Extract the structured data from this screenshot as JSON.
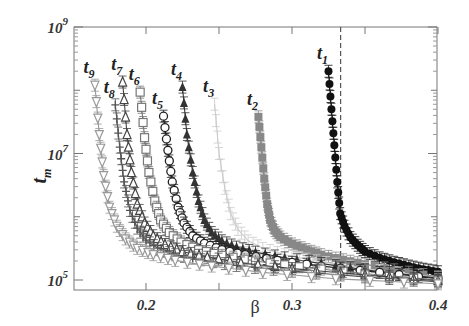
{
  "chart_data": {
    "type": "line",
    "title": "",
    "xlabel": "β",
    "ylabel": "t_m",
    "xlim": [
      0.15,
      0.4
    ],
    "ylim_log10": [
      4.84,
      9.0
    ],
    "yscale": "log",
    "grid": false,
    "legend_position": "inline labels above each curve",
    "x_ticks": [
      {
        "value": 0.2,
        "label": "0.2"
      },
      {
        "value": 0.3,
        "label": "0.3"
      },
      {
        "value": 0.4,
        "label": "0.4"
      }
    ],
    "y_ticks": [
      {
        "value": 5,
        "label": "10",
        "exp": "5"
      },
      {
        "value": 7,
        "label": "10",
        "exp": "7"
      },
      {
        "value": 9,
        "label": "10",
        "exp": "9"
      }
    ],
    "annotations": [
      {
        "type": "vertical-dashed-line",
        "x": 0.3333
      }
    ],
    "series": [
      {
        "name": "t1",
        "label": "t",
        "sub": "1",
        "marker": "filled-circle",
        "color": "#111111",
        "x": [
          0.325,
          0.327,
          0.329,
          0.331,
          0.333,
          0.336,
          0.34,
          0.345,
          0.35,
          0.36,
          0.37,
          0.38,
          0.39,
          0.4
        ],
        "log10_y": [
          8.3,
          7.7,
          7.13,
          6.55,
          6.05,
          5.85,
          5.67,
          5.55,
          5.45,
          5.35,
          5.28,
          5.22,
          5.17,
          5.13
        ]
      },
      {
        "name": "t2",
        "label": "t",
        "sub": "2",
        "marker": "filled-square",
        "color": "#888888",
        "x": [
          0.277,
          0.279,
          0.281,
          0.283,
          0.285,
          0.288,
          0.292,
          0.3,
          0.31,
          0.32,
          0.335,
          0.35,
          0.37,
          0.4
        ],
        "log10_y": [
          7.58,
          7.1,
          6.6,
          6.2,
          5.95,
          5.78,
          5.68,
          5.57,
          5.48,
          5.4,
          5.32,
          5.25,
          5.16,
          5.05
        ]
      },
      {
        "name": "t3",
        "label": "t",
        "sub": "3",
        "marker": "none",
        "color": "#cccccc",
        "x": [
          0.247,
          0.25,
          0.254,
          0.258,
          0.263,
          0.27,
          0.28,
          0.295,
          0.31,
          0.33,
          0.36,
          0.4
        ],
        "log10_y": [
          7.78,
          7.0,
          6.45,
          6.05,
          5.8,
          5.62,
          5.5,
          5.4,
          5.33,
          5.25,
          5.15,
          5.04
        ]
      },
      {
        "name": "t4",
        "label": "t",
        "sub": "4",
        "marker": "filled-triangle-up",
        "color": "#333333",
        "x": [
          0.225,
          0.228,
          0.232,
          0.236,
          0.24,
          0.245,
          0.252,
          0.262,
          0.275,
          0.295,
          0.32,
          0.35,
          0.4
        ],
        "log10_y": [
          8.05,
          7.3,
          6.7,
          6.25,
          5.95,
          5.75,
          5.62,
          5.52,
          5.44,
          5.35,
          5.26,
          5.16,
          5.03
        ]
      },
      {
        "name": "t5",
        "label": "t",
        "sub": "5",
        "marker": "open-circle",
        "color": "#222222",
        "x": [
          0.212,
          0.215,
          0.218,
          0.222,
          0.226,
          0.232,
          0.24,
          0.252,
          0.268,
          0.29,
          0.32,
          0.36,
          0.4
        ],
        "log10_y": [
          7.59,
          7.05,
          6.55,
          6.15,
          5.9,
          5.7,
          5.58,
          5.48,
          5.4,
          5.31,
          5.22,
          5.12,
          5.02
        ]
      },
      {
        "name": "t6",
        "label": "t",
        "sub": "6",
        "marker": "open-square",
        "color": "#777777",
        "x": [
          0.196,
          0.199,
          0.202,
          0.206,
          0.21,
          0.216,
          0.224,
          0.236,
          0.252,
          0.275,
          0.305,
          0.35,
          0.4
        ],
        "log10_y": [
          7.97,
          7.25,
          6.7,
          6.25,
          5.95,
          5.75,
          5.6,
          5.48,
          5.39,
          5.3,
          5.21,
          5.1,
          5.0
        ]
      },
      {
        "name": "t7",
        "label": "t",
        "sub": "7",
        "marker": "open-triangle-up",
        "color": "#444444",
        "x": [
          0.184,
          0.187,
          0.19,
          0.194,
          0.199,
          0.205,
          0.213,
          0.225,
          0.242,
          0.265,
          0.3,
          0.35,
          0.4
        ],
        "log10_y": [
          8.13,
          7.3,
          6.7,
          6.2,
          5.9,
          5.7,
          5.56,
          5.45,
          5.36,
          5.27,
          5.18,
          5.08,
          4.99
        ]
      },
      {
        "name": "t8",
        "label": "t",
        "sub": "8",
        "marker": "plus",
        "color": "#555555",
        "x": [
          0.179,
          0.182,
          0.185,
          0.189,
          0.194,
          0.2,
          0.208,
          0.22,
          0.238,
          0.262,
          0.3,
          0.35,
          0.4
        ],
        "log10_y": [
          7.77,
          7.1,
          6.55,
          6.1,
          5.82,
          5.63,
          5.5,
          5.4,
          5.32,
          5.23,
          5.14,
          5.05,
          4.97
        ]
      },
      {
        "name": "t9",
        "label": "t",
        "sub": "9",
        "marker": "open-triangle-down",
        "color": "#999999",
        "x": [
          0.165,
          0.168,
          0.171,
          0.175,
          0.18,
          0.186,
          0.194,
          0.205,
          0.22,
          0.245,
          0.28,
          0.33,
          0.4
        ],
        "log10_y": [
          8.08,
          7.3,
          6.65,
          6.15,
          5.85,
          5.65,
          5.5,
          5.4,
          5.31,
          5.22,
          5.12,
          5.02,
          4.94
        ]
      }
    ]
  },
  "axes": {
    "x_title": "β",
    "y_title_main": "t",
    "y_title_sub": "m"
  }
}
